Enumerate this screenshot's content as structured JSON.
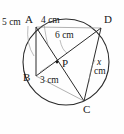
{
  "figure": {
    "kind": "circle-geometry-diagram",
    "stroke_color": "#2b2b2b",
    "light_stroke_color": "#8f8f8f",
    "background_color": "#fefefe"
  },
  "circle": {
    "center_x": 66,
    "center_y": 62,
    "radius": 43
  },
  "vertices": [
    {
      "name": "A",
      "label": "A",
      "x": 36,
      "y": 27,
      "label_x": 25,
      "label_y": 14
    },
    {
      "name": "D",
      "label": "D",
      "x": 101,
      "y": 28,
      "label_x": 104,
      "label_y": 14
    },
    {
      "name": "B",
      "label": "B",
      "x": 36,
      "y": 76,
      "label_x": 23,
      "label_y": 72
    },
    {
      "name": "C",
      "label": "C",
      "x": 84,
      "y": 101,
      "label_x": 83,
      "label_y": 104
    },
    {
      "name": "P",
      "label": "P",
      "x": 57,
      "y": 62,
      "label_x": 62,
      "label_y": 58
    }
  ],
  "measurements": [
    {
      "name": "ab-length",
      "text": "5 cm",
      "label_x": 2,
      "label_y": 17
    },
    {
      "name": "ap-length",
      "text": "4 cm",
      "label_x": 41,
      "label_y": 15
    },
    {
      "name": "pd-length",
      "text": "6 cm",
      "label_x": 55,
      "label_y": 30
    },
    {
      "name": "bp-length",
      "text": "3 cm",
      "label_x": 40,
      "label_y": 75
    },
    {
      "name": "dc-length-value",
      "text": "x",
      "label_x": 97,
      "label_y": 57
    },
    {
      "name": "dc-length-unit",
      "text": "cm",
      "label_x": 94,
      "label_y": 66
    }
  ]
}
